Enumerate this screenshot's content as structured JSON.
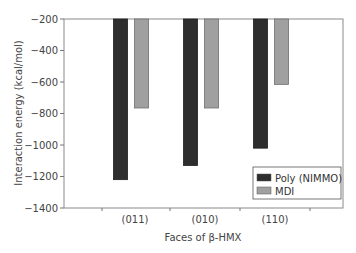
{
  "chart_data": {
    "type": "bar",
    "title": "",
    "xlabel": "Faces of β-HMX",
    "ylabel": "Interaction energy (kcal/mol)",
    "categories": [
      "(011)",
      "(010)",
      "(110)"
    ],
    "series": [
      {
        "name": "Poly (NIMMO)",
        "color": "#2e2e2e",
        "values": [
          -1220,
          -1130,
          -1020
        ]
      },
      {
        "name": "MDI",
        "color": "#a0a0a0",
        "values": [
          -765,
          -765,
          -615
        ]
      }
    ],
    "ylim": [
      -1400,
      -200
    ],
    "yticks": [
      -200,
      -400,
      -600,
      -800,
      -1000,
      -1200,
      -1400
    ],
    "ytick_labels": [
      "−200",
      "−400",
      "−600",
      "−800",
      "−1000",
      "−1200",
      "−1400"
    ],
    "bar_baseline": -200,
    "grid": false,
    "legend_position": "lower right"
  }
}
